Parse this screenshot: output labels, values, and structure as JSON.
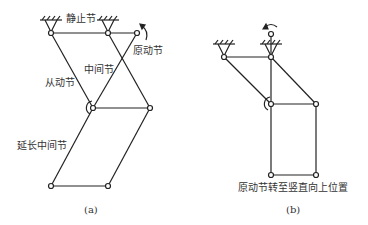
{
  "figure_a": {
    "labels": {
      "fixed_link": "静止节",
      "driving_link": "原动节",
      "middle_link": "中间节",
      "driven_link": "从动节",
      "extended_middle_link": "延长中间节"
    },
    "caption": "(a)"
  },
  "figure_b": {
    "description": "原动节转至竖直向上位置",
    "caption": "(b)"
  },
  "colors": {
    "line": "#222222",
    "text": "#333333",
    "background": "#ffffff"
  }
}
